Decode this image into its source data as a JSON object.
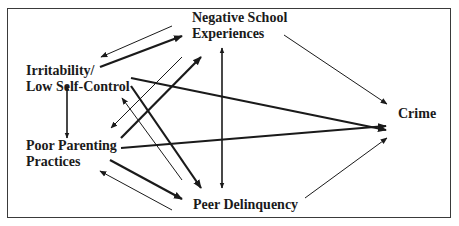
{
  "diagram": {
    "type": "path-diagram",
    "nodes": {
      "negative_school": {
        "line1": "Negative School",
        "line2": "Experiences"
      },
      "irritability": {
        "line1": "Irritability/",
        "line2": "Low Self-Control"
      },
      "poor_parenting": {
        "line1": "Poor Parenting",
        "line2": "Practices"
      },
      "peer_delinquency": {
        "label": "Peer Delinquency"
      },
      "crime": {
        "label": "Crime"
      }
    },
    "edges": [
      {
        "from": "Negative School Experiences",
        "to": "Irritability/Low Self-Control",
        "weight": "thin"
      },
      {
        "from": "Irritability/Low Self-Control",
        "to": "Negative School Experiences",
        "weight": "thick"
      },
      {
        "from": "Negative School Experiences",
        "to": "Poor Parenting Practices",
        "weight": "thin"
      },
      {
        "from": "Poor Parenting Practices",
        "to": "Negative School Experiences",
        "weight": "thick"
      },
      {
        "from": "Irritability/Low Self-Control",
        "to": "Crime",
        "weight": "thick"
      },
      {
        "from": "Irritability/Low Self-Control",
        "to": "Peer Delinquency",
        "weight": "thick"
      },
      {
        "from": "Peer Delinquency",
        "to": "Irritability/Low Self-Control",
        "weight": "thin"
      },
      {
        "from": "Negative School Experiences",
        "to": "Peer Delinquency",
        "weight": "medium",
        "bidirectional": true
      },
      {
        "from": "Irritability/Low Self-Control",
        "to": "Poor Parenting Practices",
        "weight": "medium",
        "bidirectional": true
      },
      {
        "from": "Poor Parenting Practices",
        "to": "Crime",
        "weight": "thick"
      },
      {
        "from": "Poor Parenting Practices",
        "to": "Peer Delinquency",
        "weight": "thick"
      },
      {
        "from": "Peer Delinquency",
        "to": "Poor Parenting Practices",
        "weight": "thin"
      },
      {
        "from": "Negative School Experiences",
        "to": "Crime",
        "weight": "thin"
      },
      {
        "from": "Peer Delinquency",
        "to": "Crime",
        "weight": "thin"
      }
    ],
    "colors": {
      "line": "#1a1a1a",
      "background": "#ffffff",
      "frame": "#3a3a3a"
    }
  }
}
